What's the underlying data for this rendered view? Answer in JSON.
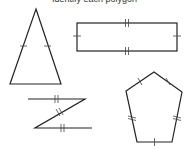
{
  "header": {
    "text": "Identify each polygon"
  },
  "diagram": {
    "stroke_color": "#222222",
    "shapes": [
      {
        "name": "isosceles-triangle",
        "points": [
          [
            36,
            9
          ],
          [
            61,
            84
          ],
          [
            10,
            84
          ]
        ],
        "tick_marks": "single ticks on the two equal legs"
      },
      {
        "name": "rectangle",
        "points": [
          [
            77,
            23
          ],
          [
            177,
            23
          ],
          [
            177,
            51
          ],
          [
            77,
            51
          ]
        ],
        "tick_marks": "double ticks on top and bottom, single ticks on left and right"
      },
      {
        "name": "z-shape",
        "points": [
          [
            28,
            99
          ],
          [
            85,
            99
          ],
          [
            35,
            128
          ],
          [
            92,
            128
          ]
        ],
        "tick_marks": "double ticks on all three segments"
      },
      {
        "name": "regular-pentagon",
        "points": [
          [
            154,
            72
          ],
          [
            182,
            92
          ],
          [
            172,
            142
          ],
          [
            137,
            142
          ],
          [
            126,
            91
          ]
        ],
        "tick_marks": "single ticks on all five sides"
      }
    ]
  }
}
